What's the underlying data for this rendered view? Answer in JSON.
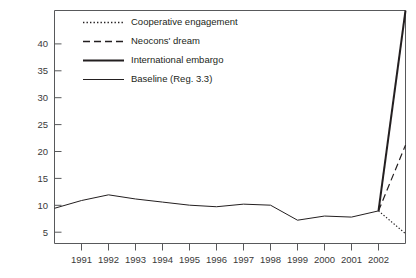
{
  "chart_data": {
    "type": "line",
    "title": "",
    "subtitle": "",
    "xlabel": "",
    "ylabel": "",
    "xlim": [
      1990,
      2003
    ],
    "ylim": [
      0,
      45
    ],
    "yticks": [
      5,
      10,
      15,
      20,
      25,
      30,
      35,
      40
    ],
    "ytick_labels": [
      "5",
      "10",
      "15",
      "20",
      "25",
      "30",
      "35",
      "40"
    ],
    "xticks": [
      1991,
      1992,
      1993,
      1994,
      1995,
      1996,
      1997,
      1998,
      1999,
      2000,
      2001,
      2002,
      2003
    ],
    "xtick_labels": [
      "1991",
      "1992",
      "1993",
      "1994",
      "1995",
      "1996",
      "1997",
      "1998",
      "1999",
      "2000",
      "2001",
      "2002",
      ""
    ],
    "grid": false,
    "legend_position": "top-left",
    "series": [
      {
        "name": "Cooperative engagement",
        "style": "dotted",
        "color": "#231f20",
        "width": 1.2,
        "x": [
          2002,
          2003
        ],
        "values": [
          6.3,
          1.9
        ]
      },
      {
        "name": "Neocons' dream",
        "style": "dashed",
        "color": "#231f20",
        "width": 1.2,
        "x": [
          2002,
          2003
        ],
        "values": [
          6.3,
          19.0
        ]
      },
      {
        "name": "International embargo",
        "style": "solid-thick",
        "color": "#231f20",
        "width": 2.0,
        "x": [
          2002,
          2003
        ],
        "values": [
          6.3,
          45.0
        ]
      },
      {
        "name": "Baseline (Reg. 3.3)",
        "style": "solid-thin",
        "color": "#231f20",
        "width": 1.0,
        "x": [
          1990,
          1991,
          1992,
          1993,
          1994,
          1995,
          1996,
          1997,
          1998,
          1999,
          2000,
          2001,
          2002
        ],
        "values": [
          6.8,
          8.3,
          9.4,
          8.6,
          8.0,
          7.4,
          7.1,
          7.6,
          7.4,
          4.5,
          5.3,
          5.1,
          6.3
        ]
      }
    ]
  },
  "legend": {
    "items": [
      {
        "label": "Cooperative engagement",
        "style": "dotted"
      },
      {
        "label": "Neocons' dream",
        "style": "dashed"
      },
      {
        "label": "International embargo",
        "style": "solid-thick"
      },
      {
        "label": "Baseline (Reg. 3.3)",
        "style": "solid-thin"
      }
    ]
  }
}
